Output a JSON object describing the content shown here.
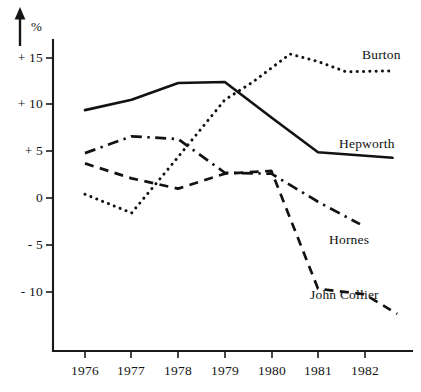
{
  "chart_data": {
    "type": "line",
    "title": "",
    "xlabel": "",
    "ylabel": "%",
    "ylim": [
      -14,
      17
    ],
    "xlim": [
      1975.7,
      1982.9
    ],
    "grid": false,
    "legend_position": "inline-right",
    "y_ticks": [
      "+ 15",
      "+ 10",
      "+ 5",
      "0",
      "- 5",
      "- 10"
    ],
    "y_tick_values": [
      15,
      10,
      5,
      0,
      -5,
      -10
    ],
    "x_ticks": [
      "1976",
      "1977",
      "1978",
      "1979",
      "1980",
      "1981",
      "1982"
    ],
    "x_tick_values": [
      1976,
      1977,
      1978,
      1979,
      1980,
      1981,
      1982
    ],
    "series": [
      {
        "name": "Burton",
        "style": "dotted",
        "x": [
          1976.0,
          1977.0,
          1978.0,
          1979.0,
          1979.6,
          1980.4,
          1981.0,
          1981.6,
          1982.6
        ],
        "values": [
          0.4,
          -1.6,
          4.4,
          10.5,
          12.4,
          15.4,
          14.6,
          13.5,
          13.6
        ]
      },
      {
        "name": "Hepworth",
        "style": "solid",
        "x": [
          1976.0,
          1977.0,
          1978.0,
          1979.0,
          1980.0,
          1981.0,
          1982.6
        ],
        "values": [
          9.4,
          10.5,
          12.3,
          12.4,
          8.6,
          4.9,
          4.3
        ]
      },
      {
        "name": "Hornes",
        "style": "dash-dot",
        "x": [
          1976.0,
          1977.0,
          1978.0,
          1979.0,
          1980.0,
          1981.0,
          1981.9
        ],
        "values": [
          4.8,
          6.6,
          6.3,
          2.7,
          2.6,
          -0.4,
          -2.8
        ]
      },
      {
        "name": "John Collier",
        "style": "dashed",
        "x": [
          1976.0,
          1977.0,
          1978.0,
          1979.0,
          1980.0,
          1981.0,
          1982.0,
          1982.7
        ],
        "values": [
          3.7,
          2.1,
          1.0,
          2.6,
          2.9,
          -9.7,
          -10.3,
          -12.4
        ]
      }
    ]
  },
  "axis": {
    "y_unit_label": "%",
    "y_tick_labels": [
      "+ 15",
      "+ 10",
      "+ 5",
      "0",
      "- 5",
      "- 10"
    ],
    "x_tick_labels": [
      "1976",
      "1977",
      "1978",
      "1979",
      "1980",
      "1981",
      "1982"
    ]
  },
  "series_labels": {
    "burton": "Burton",
    "hepworth": "Hepworth",
    "hornes": "Hornes",
    "john_collier": "John Collier"
  }
}
